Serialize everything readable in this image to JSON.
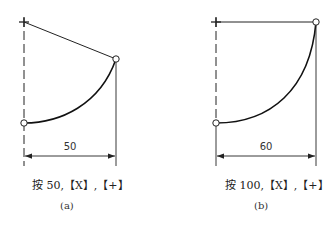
{
  "figures": [
    {
      "id": "a",
      "dimension_label": "50",
      "caption": "按 50,【X】,【+】",
      "sublabel": "(a)"
    },
    {
      "id": "b",
      "dimension_label": "60",
      "caption": "按 100,【X】,【+】",
      "sublabel": "(b)"
    }
  ],
  "colors": {
    "line": "#222222",
    "background": "#ffffff"
  }
}
